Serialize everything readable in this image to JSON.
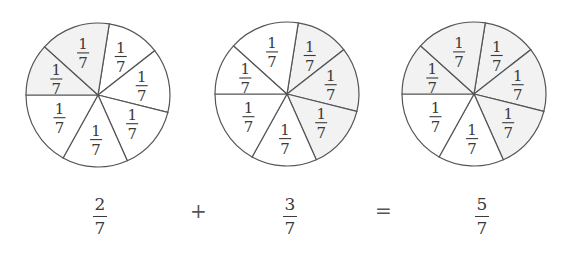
{
  "diagram": {
    "title": "",
    "stroke_color": "#555555",
    "shade_color": "#f2f2f2",
    "unshaded_color": "#ffffff",
    "circles": [
      {
        "id": "circle-1",
        "center": [
          98,
          95
        ],
        "radius": 72,
        "sectors": 7,
        "sector_label": {
          "numerator": "1",
          "denominator": "7"
        },
        "shaded_sectors": [
          5,
          6
        ],
        "shaded_count": 2
      },
      {
        "id": "circle-2",
        "center": [
          287,
          94
        ],
        "radius": 72,
        "sectors": 7,
        "sector_label": {
          "numerator": "1",
          "denominator": "7"
        },
        "shaded_sectors": [
          0,
          1,
          2
        ],
        "shaded_count": 3
      },
      {
        "id": "circle-3",
        "center": [
          474,
          94
        ],
        "radius": 72,
        "sectors": 7,
        "sector_label": {
          "numerator": "1",
          "denominator": "7"
        },
        "shaded_sectors": [
          0,
          1,
          2,
          5,
          6
        ],
        "shaded_count": 5
      }
    ],
    "spoke_angles_deg": [
      -81,
      -38,
      14,
      66,
      119,
      180,
      222
    ]
  },
  "equation": {
    "term1": {
      "numerator": "2",
      "denominator": "7"
    },
    "plus": "+",
    "term2": {
      "numerator": "3",
      "denominator": "7"
    },
    "equals": "=",
    "result": {
      "numerator": "5",
      "denominator": "7"
    }
  }
}
